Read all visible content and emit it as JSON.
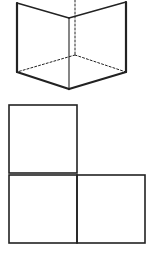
{
  "figure": {
    "background": "#ffffff",
    "stroke_color": "#222222",
    "cube": {
      "description": "Isometric cube viewed from below-ish angle with hidden edges dashed",
      "vertices": {
        "top_left": [
          17,
          3
        ],
        "top_right": [
          126,
          2
        ],
        "front_top": [
          69,
          18
        ],
        "left_bottom": [
          17,
          72
        ],
        "right_bottom": [
          126,
          72
        ],
        "front_bottom": [
          69,
          89
        ],
        "back_bottom": [
          75,
          55
        ],
        "back_top": [
          75,
          0
        ]
      },
      "solid_edge_width": 2.2,
      "thin_edge_width": 1.1,
      "dashed_edge_width": 1,
      "dash_pattern": "2,2"
    },
    "l_shape": {
      "description": "Three squares arranged in an L (orthographic view)",
      "squares": [
        {
          "x": 9,
          "y": 105,
          "size": 68
        },
        {
          "x": 9,
          "y": 175,
          "size": 68
        },
        {
          "x": 77,
          "y": 175,
          "size": 68
        }
      ],
      "stroke_width": 1.6
    }
  }
}
